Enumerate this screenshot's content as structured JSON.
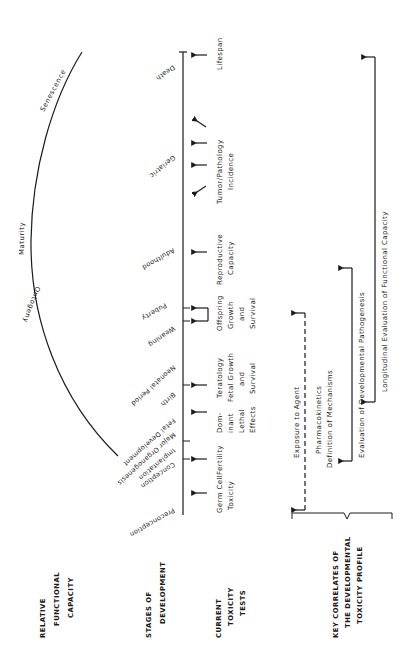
{
  "row_headers": {
    "relative_functional_capacity": [
      "RELATIVE",
      "FUNCTIONAL",
      "CAPACITY"
    ],
    "stages_of_development": [
      "STAGES OF",
      "DEVELOPMENT"
    ],
    "current_toxicity_tests": [
      "CURRENT",
      "TOXICITY",
      "TESTS"
    ],
    "key_correlates": [
      "KEY CORRELATES OF",
      "THE DEVELOPMENTAL",
      "TOXICITY PROFILE"
    ]
  },
  "capacity_curve": {
    "labels": [
      "Ontogeny",
      "Maturity",
      "Senescence"
    ]
  },
  "stages": [
    "Preconception",
    "Conception",
    "Implantation",
    "Major Organogenesis",
    "Fetal Development",
    "Birth",
    "Neonatal Period",
    "Weaning",
    "Puberty",
    "Adulthood",
    "Geriatric",
    "Death"
  ],
  "toxicity_tests": [
    {
      "lines": [
        "Germ Cell",
        "Toxicity"
      ]
    },
    {
      "lines": [
        "Fertility"
      ]
    },
    {
      "lines": [
        "Dom-",
        "inant",
        "Lethal",
        "Effects"
      ]
    },
    {
      "lines": [
        "Teratology",
        "Fetal Growth",
        "and",
        "Survival"
      ]
    },
    {
      "lines": [
        "Offspring",
        "Growth",
        "and",
        "Survival"
      ]
    },
    {
      "lines": [
        "Reproductive",
        "Capacity"
      ]
    },
    {
      "lines": [
        "Tumor/Pathology",
        "Incidence"
      ]
    },
    {
      "lines": [
        "Lifespan"
      ]
    }
  ],
  "key_correlates": {
    "exposure": "Exposure to Agent",
    "pharmacokinetics": "Pharmacokinetics",
    "mechanisms": "Definition of Mechanisms",
    "pathogenesis": "Evaluation of Developmental Pathogenesis",
    "longitudinal": "Longitudinal Evaluation of Functional Capacity"
  }
}
